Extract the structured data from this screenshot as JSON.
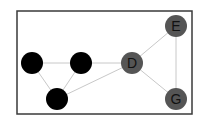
{
  "diagram": {
    "type": "undirected-graph",
    "frame": {
      "x": 17,
      "y": 11,
      "width": 175,
      "height": 103,
      "stroke": "#3a3a3a"
    },
    "edge_color": "#c8c8c8",
    "nodes": [
      {
        "id": "n1",
        "label": "",
        "x": 32,
        "y": 63,
        "r": 11,
        "fill": "#000000",
        "text_color": "#000000"
      },
      {
        "id": "n2",
        "label": "",
        "x": 81,
        "y": 63,
        "r": 11,
        "fill": "#000000",
        "text_color": "#000000"
      },
      {
        "id": "n3",
        "label": "",
        "x": 57,
        "y": 99,
        "r": 11,
        "fill": "#000000",
        "text_color": "#000000"
      },
      {
        "id": "D",
        "label": "D",
        "x": 132,
        "y": 63,
        "r": 11,
        "fill": "#555555",
        "text_color": "#111111"
      },
      {
        "id": "E",
        "label": "E",
        "x": 176,
        "y": 26,
        "r": 11,
        "fill": "#555555",
        "text_color": "#111111"
      },
      {
        "id": "G",
        "label": "G",
        "x": 176,
        "y": 99,
        "r": 11,
        "fill": "#555555",
        "text_color": "#111111"
      }
    ],
    "edges": [
      [
        "n1",
        "n2"
      ],
      [
        "n1",
        "n3"
      ],
      [
        "n2",
        "n3"
      ],
      [
        "n2",
        "D"
      ],
      [
        "n3",
        "D"
      ],
      [
        "D",
        "E"
      ],
      [
        "D",
        "G"
      ],
      [
        "E",
        "G"
      ]
    ]
  }
}
